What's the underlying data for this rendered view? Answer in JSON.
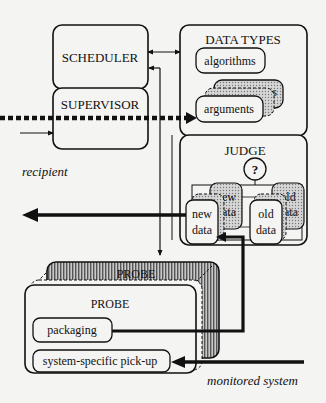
{
  "diagram": {
    "type": "architecture-block-diagram",
    "blocks": {
      "scheduler": {
        "label": "SCHEDULER"
      },
      "supervisor": {
        "label": "SUPERVISOR"
      },
      "data_types": {
        "title": "DATA TYPES",
        "items": {
          "algorithms": "algorithms",
          "arguments_back": "arguments",
          "arguments_front": "arguments"
        }
      },
      "judge": {
        "title": "JUDGE",
        "decision_symbol": "?",
        "back_new_top": "new",
        "back_new_bottom": "data",
        "back_old_top": "old",
        "back_old_bottom": "data",
        "front_new_top": "new",
        "front_new_bottom": "data",
        "front_old_top": "old",
        "front_old_bottom": "data"
      },
      "probe_back": {
        "title": "PROBE"
      },
      "probe_front": {
        "title": "PROBE",
        "packaging": "packaging",
        "pickup": "system-specific pick-up"
      }
    },
    "external_labels": {
      "recipient": "recipient",
      "monitored_system": "monitored system"
    },
    "colors": {
      "ink": "#111111",
      "paper": "#f4f4f2",
      "shade": "#b8b8b8",
      "hatch": "#7a7a7a"
    }
  }
}
